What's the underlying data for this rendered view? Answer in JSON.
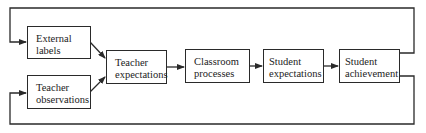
{
  "diagram": {
    "type": "flowchart",
    "colors": {
      "line": "#2a2a2a",
      "background": "#ffffff",
      "text": "#222222"
    },
    "nodes": [
      {
        "id": "external_labels",
        "line1": "External",
        "line2": "labels"
      },
      {
        "id": "teacher_observations",
        "line1": "Teacher",
        "line2": "observations"
      },
      {
        "id": "teacher_expectations",
        "line1": "Teacher",
        "line2": "expectations"
      },
      {
        "id": "classroom_processes",
        "line1": "Classroom",
        "line2": "processes"
      },
      {
        "id": "student_expectations",
        "line1": "Student",
        "line2": "expectations"
      },
      {
        "id": "student_achievement",
        "line1": "Student",
        "line2": "achievement"
      }
    ],
    "edges": [
      {
        "from": "external_labels",
        "to": "teacher_expectations"
      },
      {
        "from": "teacher_observations",
        "to": "teacher_expectations"
      },
      {
        "from": "teacher_expectations",
        "to": "classroom_processes"
      },
      {
        "from": "classroom_processes",
        "to": "student_expectations"
      },
      {
        "from": "student_expectations",
        "to": "student_achievement"
      },
      {
        "from": "student_achievement",
        "to": "external_labels",
        "kind": "feedback-top"
      },
      {
        "from": "student_achievement",
        "to": "teacher_observations",
        "kind": "feedback-bottom"
      }
    ]
  }
}
